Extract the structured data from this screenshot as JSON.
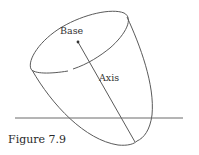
{
  "figure": {
    "caption": "Figure 7.9",
    "labels": {
      "base": "Base",
      "axis": "Axis"
    },
    "colors": {
      "stroke": "#5a5a5a",
      "text": "#333333",
      "background": "#ffffff"
    }
  }
}
